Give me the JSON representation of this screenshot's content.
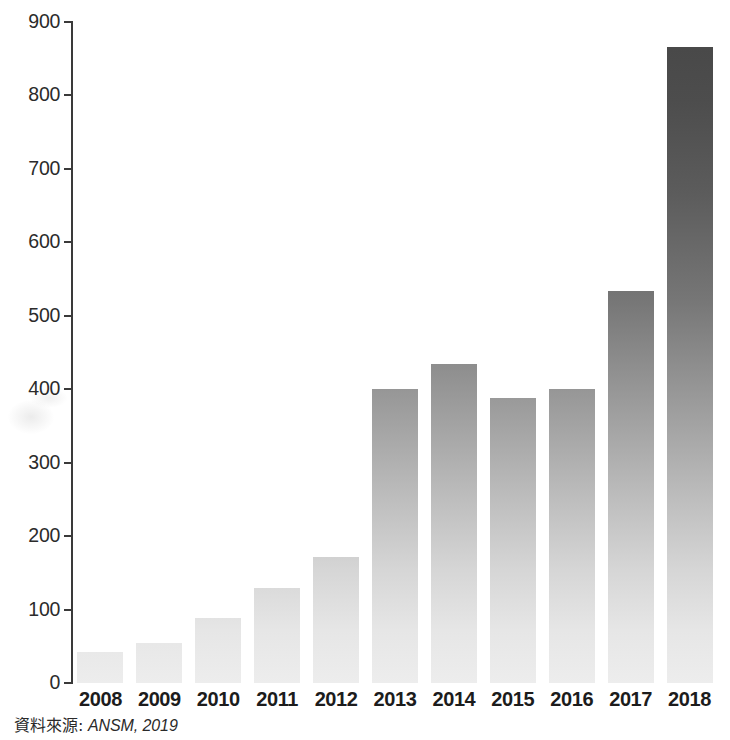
{
  "chart_data": {
    "type": "bar",
    "title": "",
    "subtitle": "",
    "xlabel": "",
    "ylabel": "",
    "categories": [
      "2008",
      "2009",
      "2010",
      "2011",
      "2012",
      "2013",
      "2014",
      "2015",
      "2016",
      "2017",
      "2018"
    ],
    "values": [
      42,
      55,
      88,
      129,
      171,
      401,
      434,
      388,
      401,
      534,
      866
    ],
    "ylim": [
      0,
      900
    ],
    "ytick_labels": [
      "0",
      "100",
      "200",
      "300",
      "400",
      "500",
      "600",
      "700",
      "800",
      "900"
    ],
    "ytick_values": [
      0,
      100,
      200,
      300,
      400,
      500,
      600,
      700,
      800,
      900
    ],
    "grid": false,
    "legend": null,
    "bar_color_top": "#474747",
    "bar_color_bottom": "#ededed",
    "axis_color": "#3a3a3a"
  },
  "caption": {
    "source_label": "資料來源:",
    "source_value": "ANSM, 2019"
  }
}
